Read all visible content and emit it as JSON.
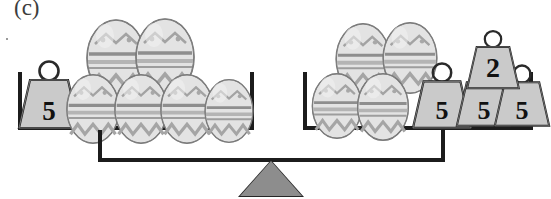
{
  "figure": {
    "label": "(c)",
    "type": "balance-scale-diagram"
  },
  "balance": {
    "fulcrum_icon": "triangle-fulcrum-icon",
    "state": "level",
    "left_pan": {
      "name": "left-pan",
      "eggs": {
        "count": 6,
        "bottom_row": 4,
        "top_row": 2,
        "icon": "decorated-egg-icon"
      },
      "weights": [
        {
          "value": "5",
          "icon": "weight-icon"
        }
      ]
    },
    "right_pan": {
      "name": "right-pan",
      "eggs": {
        "count": 4,
        "bottom_row": 2,
        "top_row": 2,
        "icon": "decorated-egg-icon"
      },
      "weights": [
        {
          "value": "5",
          "icon": "weight-icon"
        },
        {
          "value": "5",
          "icon": "weight-icon"
        },
        {
          "value": "5",
          "icon": "weight-icon"
        },
        {
          "value": "2",
          "icon": "weight-icon"
        }
      ]
    }
  },
  "colors": {
    "ink": "#1c1c1c",
    "fulcrum_fill": "#8d8d8d",
    "weight_fill": "#c9c9c9",
    "egg_fill": "#e0e0e0",
    "egg_band": "#9b9b9b",
    "paper": "#ffffff"
  }
}
